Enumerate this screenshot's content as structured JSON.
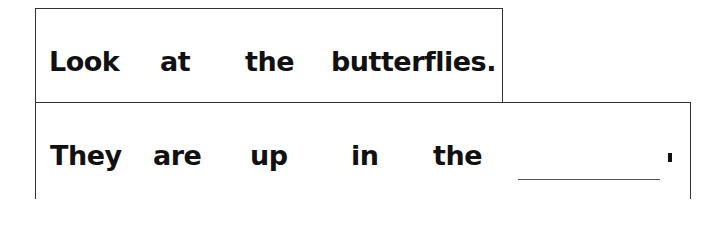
{
  "sentences": [
    {
      "words": [
        "Look",
        "at",
        "the",
        "butterflies."
      ]
    },
    {
      "words": [
        "They",
        "are",
        "up",
        "in",
        "the"
      ],
      "blank": "",
      "end_punctuation": "."
    }
  ]
}
